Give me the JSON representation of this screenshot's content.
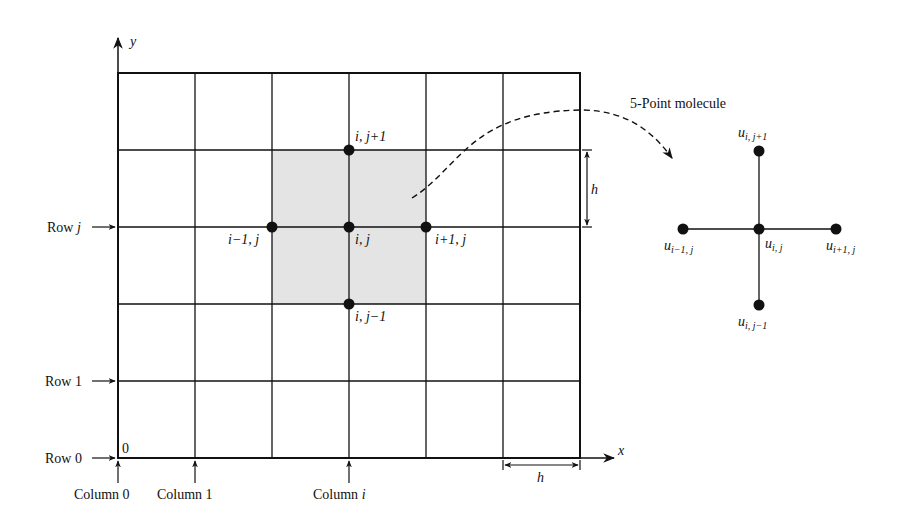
{
  "figure": {
    "axes": {
      "x_label": "x",
      "y_label": "y",
      "origin_label": "0"
    },
    "grid": {
      "columns": 6,
      "rows": 5,
      "spacing_label": "h",
      "shaded_region": "2×2 cells centered on node (i, j)"
    },
    "row_labels": [
      "Row j",
      "Row 1",
      "Row 0"
    ],
    "column_labels": [
      "Column 0",
      "Column 1",
      "Column i"
    ],
    "nodes": {
      "top": "i, j+1",
      "left": "i−1, j",
      "center": "i, j",
      "right": "i+1, j",
      "bottom": "i, j−1"
    },
    "molecule": {
      "title": "5-Point molecule",
      "var": "u",
      "top_sub": "i, j+1",
      "left_sub": "i−1, j",
      "center_sub": "i, j",
      "right_sub": "i+1, j",
      "bottom_sub": "i, j−1"
    },
    "colors": {
      "line": "#111111",
      "shade": "#e4e4e4",
      "background": "#ffffff"
    }
  }
}
